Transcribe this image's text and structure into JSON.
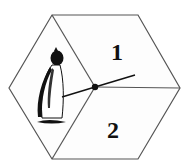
{
  "diagram": {
    "type": "spinner",
    "shape": "hexagon",
    "sections": [
      {
        "id": "left",
        "content": "penguin-image",
        "label": ""
      },
      {
        "id": "top-right",
        "label": "1"
      },
      {
        "id": "bottom-right",
        "label": "2"
      }
    ],
    "pointer": {
      "points_to": "left",
      "pivot": "center"
    },
    "colors": {
      "outline": "#555555",
      "ink": "#111111",
      "background": "#ffffff"
    }
  }
}
